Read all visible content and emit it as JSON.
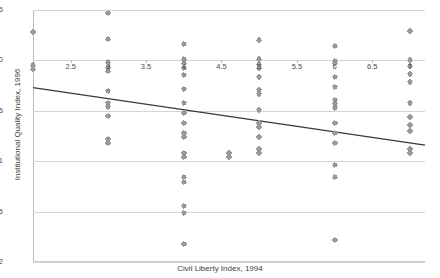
{
  "chart_data": {
    "type": "scatter",
    "title": "",
    "xlabel": "Civil Liberty Index, 1994",
    "ylabel": "Institutional Quality Index, 1996",
    "xlim": [
      2,
      7.2
    ],
    "ylim": [
      -2,
      0.5
    ],
    "grid": true,
    "legend": false,
    "xticks": [
      2.5,
      3,
      3.5,
      4,
      4.5,
      5,
      5.5,
      6,
      6.5,
      7
    ],
    "xtick_labels": [
      "2.5",
      "3",
      "3.5",
      "4",
      "4.5",
      "5",
      "5.5",
      "6",
      "6.5",
      "7"
    ],
    "yticks": [
      0.5,
      0,
      -0.5,
      -1,
      -1.5,
      -2
    ],
    "ytick_labels": [
      "0.5",
      "0",
      "-0.5",
      "-1",
      "-1.5",
      "-2"
    ],
    "marker": "diamond-cross",
    "marker_color": "#8f8f97",
    "trendline": {
      "type": "linear",
      "color": "#3a3a3a",
      "x0": 2.0,
      "y0": -0.27,
      "x1": 7.2,
      "y1": -0.84
    },
    "points": [
      {
        "x": 2.0,
        "y": 0.28
      },
      {
        "x": 2.0,
        "y": -0.05
      },
      {
        "x": 2.0,
        "y": -0.09
      },
      {
        "x": 3.0,
        "y": 0.47
      },
      {
        "x": 3.0,
        "y": 0.21
      },
      {
        "x": 3.0,
        "y": -0.02
      },
      {
        "x": 3.0,
        "y": -0.07
      },
      {
        "x": 3.0,
        "y": -0.11
      },
      {
        "x": 3.0,
        "y": -0.3
      },
      {
        "x": 3.0,
        "y": -0.42
      },
      {
        "x": 3.0,
        "y": -0.46
      },
      {
        "x": 3.0,
        "y": -0.55
      },
      {
        "x": 3.0,
        "y": -0.78
      },
      {
        "x": 3.0,
        "y": -0.82
      },
      {
        "x": 4.0,
        "y": 0.16
      },
      {
        "x": 4.0,
        "y": 0.01
      },
      {
        "x": 4.0,
        "y": -0.03
      },
      {
        "x": 4.0,
        "y": -0.08
      },
      {
        "x": 4.0,
        "y": -0.14
      },
      {
        "x": 4.0,
        "y": -0.28
      },
      {
        "x": 4.0,
        "y": -0.42
      },
      {
        "x": 4.0,
        "y": -0.52
      },
      {
        "x": 4.0,
        "y": -0.62
      },
      {
        "x": 4.0,
        "y": -0.72
      },
      {
        "x": 4.0,
        "y": -0.76
      },
      {
        "x": 4.0,
        "y": -0.92
      },
      {
        "x": 4.0,
        "y": -0.96
      },
      {
        "x": 4.0,
        "y": -1.16
      },
      {
        "x": 4.0,
        "y": -1.21
      },
      {
        "x": 4.0,
        "y": -1.44
      },
      {
        "x": 4.0,
        "y": -1.51
      },
      {
        "x": 4.0,
        "y": -1.82
      },
      {
        "x": 4.6,
        "y": -0.92
      },
      {
        "x": 4.6,
        "y": -0.96
      },
      {
        "x": 5.0,
        "y": 0.2
      },
      {
        "x": 5.0,
        "y": 0.01
      },
      {
        "x": 5.0,
        "y": -0.04
      },
      {
        "x": 5.0,
        "y": -0.08
      },
      {
        "x": 5.0,
        "y": -0.16
      },
      {
        "x": 5.0,
        "y": -0.29
      },
      {
        "x": 5.0,
        "y": -0.33
      },
      {
        "x": 5.0,
        "y": -0.49
      },
      {
        "x": 5.0,
        "y": -0.62
      },
      {
        "x": 5.0,
        "y": -0.66
      },
      {
        "x": 5.0,
        "y": -0.76
      },
      {
        "x": 5.0,
        "y": -0.88
      },
      {
        "x": 5.0,
        "y": -0.92
      },
      {
        "x": 6.0,
        "y": 0.14
      },
      {
        "x": 6.0,
        "y": -0.01
      },
      {
        "x": 6.0,
        "y": -0.03
      },
      {
        "x": 6.0,
        "y": -0.16
      },
      {
        "x": 6.0,
        "y": -0.26
      },
      {
        "x": 6.0,
        "y": -0.39
      },
      {
        "x": 6.0,
        "y": -0.43
      },
      {
        "x": 6.0,
        "y": -0.47
      },
      {
        "x": 6.0,
        "y": -0.62
      },
      {
        "x": 6.0,
        "y": -0.72
      },
      {
        "x": 6.0,
        "y": -0.82
      },
      {
        "x": 6.0,
        "y": -1.04
      },
      {
        "x": 6.0,
        "y": -1.16
      },
      {
        "x": 6.0,
        "y": -1.78
      },
      {
        "x": 7.0,
        "y": 0.29
      },
      {
        "x": 7.0,
        "y": 0.0
      },
      {
        "x": 7.0,
        "y": -0.06
      },
      {
        "x": 7.0,
        "y": -0.13
      },
      {
        "x": 7.0,
        "y": -0.21
      },
      {
        "x": 7.0,
        "y": -0.42
      },
      {
        "x": 7.0,
        "y": -0.56
      },
      {
        "x": 7.0,
        "y": -0.64
      },
      {
        "x": 7.0,
        "y": -0.7
      },
      {
        "x": 7.0,
        "y": -0.88
      },
      {
        "x": 7.0,
        "y": -0.92
      }
    ]
  }
}
